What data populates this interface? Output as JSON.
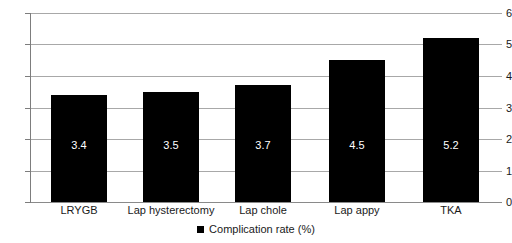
{
  "chart_data": {
    "type": "bar",
    "title": "",
    "xlabel": "",
    "ylabel": "",
    "categories": [
      "LRYGB",
      "Lap hysterectomy",
      "Lap chole",
      "Lap appy",
      "TKA"
    ],
    "values": [
      3.4,
      3.5,
      3.7,
      4.5,
      5.2
    ],
    "value_labels": [
      "3.4",
      "3.5",
      "3.7",
      "4.5",
      "5.2"
    ],
    "series": [
      {
        "name": "Complication rate (%)",
        "values": [
          3.4,
          3.5,
          3.7,
          4.5,
          5.2
        ],
        "color": "#000000"
      }
    ],
    "ylim": [
      0,
      6
    ],
    "ytick_step": 1,
    "ytick_labels": [
      "6",
      "5",
      "4",
      "3",
      "2",
      "1",
      "0"
    ],
    "grid": true,
    "grid_axis": "y",
    "legend": {
      "position": "bottom-center",
      "entries": [
        {
          "label": "Complication rate (%)",
          "color": "#000000",
          "marker": "square"
        }
      ]
    },
    "bar_color": "#000000",
    "value_label_color": "#ffffff",
    "background_color": "#ffffff",
    "gridline_color": "#a8a8a8"
  }
}
